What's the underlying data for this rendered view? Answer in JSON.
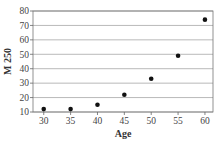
{
  "chart_data": {
    "type": "scatter",
    "title": "",
    "xlabel": "Age",
    "ylabel": "M 250",
    "x": [
      30,
      35,
      40,
      45,
      50,
      55,
      60
    ],
    "series": [
      {
        "name": "M 250",
        "values": [
          12,
          12,
          15,
          22,
          33,
          49,
          74
        ]
      }
    ],
    "xticks": [
      30,
      35,
      40,
      45,
      50,
      55,
      60
    ],
    "yticks": [
      10,
      20,
      30,
      40,
      50,
      60,
      70,
      80
    ],
    "xlim": [
      28,
      61.5
    ],
    "ylim": [
      10,
      80
    ],
    "grid": "horizontal",
    "legend": "none",
    "colors": {
      "marker": "#111111",
      "grid": "#999999",
      "axis": "#666666"
    }
  }
}
